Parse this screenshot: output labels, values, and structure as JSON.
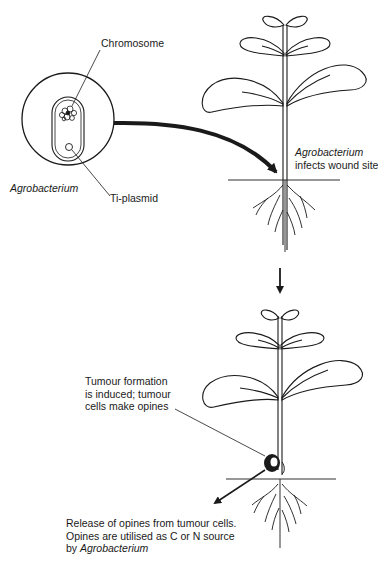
{
  "diagram": {
    "bacterium": {
      "name": "Agrobacterium",
      "chromosome_label": "Chromosome",
      "plasmid_label": "Ti-plasmid"
    },
    "step1": {
      "caption_italic": "Agrobacterium",
      "caption_rest": "infects wound site"
    },
    "step2": {
      "tumour_line1": "Tumour formation",
      "tumour_line2": "is induced; tumour",
      "tumour_line3": "cells make opines",
      "release_line1": "Release of opines from tumour cells.",
      "release_line2": "Opines are utilised as C or N source",
      "release_line3_prefix": "by ",
      "release_line3_italic": "Agrobacterium"
    },
    "colors": {
      "ink": "#1a1a1a",
      "background": "#ffffff"
    }
  }
}
